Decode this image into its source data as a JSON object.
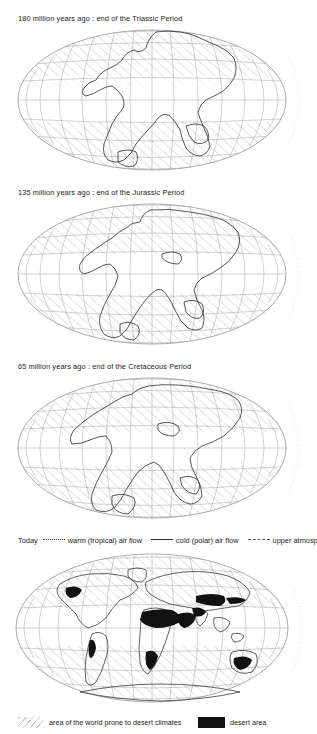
{
  "document": {
    "faint_header": "··· ········",
    "type": "paleogeographic map series"
  },
  "panels": [
    {
      "id": "triassic",
      "caption": "180 million years ago : end of the Triassic Period",
      "era": "Triassic"
    },
    {
      "id": "jurassic",
      "caption": "135 million years ago : end of the Jurassic Period",
      "era": "Jurassic"
    },
    {
      "id": "cretaceous",
      "caption": "65 million years ago : end of the Cretaceous Period",
      "era": "Cretaceous"
    },
    {
      "id": "today",
      "caption": "Today",
      "era": "Present"
    }
  ],
  "today_legend": {
    "label": "Today",
    "items": [
      {
        "line": "dotted",
        "label": "warm (tropical) air flow"
      },
      {
        "line": "solid",
        "label": "cold (polar) air flow"
      },
      {
        "line": "dashdot",
        "label": "upper atmosphere air flow"
      }
    ]
  },
  "bottom_legend": {
    "items": [
      {
        "swatch": "hatch",
        "label": "area of the world prone to desert climates"
      },
      {
        "swatch": "black",
        "label": "desert area"
      }
    ]
  },
  "colors": {
    "ink": "#1a1a1a",
    "graticule": "#8a8a8a",
    "coastline": "#3a3a3a",
    "hatch": "#c9c9c9",
    "desert": "#111111",
    "page": "#ffffff"
  }
}
